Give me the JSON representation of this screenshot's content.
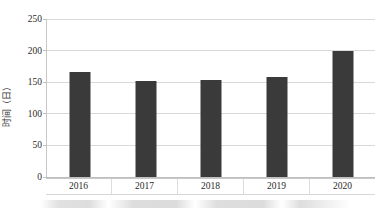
{
  "chart_data": {
    "type": "bar",
    "title": "",
    "subtitle": "",
    "xlabel": "",
    "ylabel": "时间（日）",
    "categories": [
      "2016",
      "2017",
      "2018",
      "2019",
      "2020"
    ],
    "values": [
      166,
      152,
      154,
      159,
      199
    ],
    "series": [
      {
        "name": "时间（日）",
        "values": [
          166,
          152,
          154,
          159,
          199
        ]
      }
    ],
    "ylim": [
      0,
      250
    ],
    "ytick_labels": [
      "0",
      "50",
      "100",
      "150",
      "200",
      "250"
    ],
    "ytick_values": [
      0,
      50,
      100,
      150,
      200,
      250
    ],
    "grid": true,
    "legend": false,
    "legend_position": "none",
    "bar_color": "#3a3a3a",
    "gridline_color": "#d9d9d9",
    "axis_color": "#c8c8c8",
    "background_color": "#ffffff",
    "annotations": []
  }
}
